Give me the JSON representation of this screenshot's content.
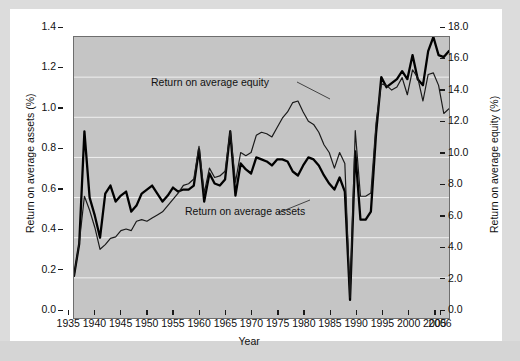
{
  "chart_data": {
    "type": "line",
    "title": "",
    "xlabel": "Year",
    "ylabel": "Return on average assets (%)",
    "y2label": "Return on average equity (%)",
    "xlim": [
      1934,
      2006
    ],
    "ylim": [
      0.0,
      1.4
    ],
    "y2lim": [
      0.0,
      18.0
    ],
    "grid": true,
    "legend_position": "inline-annotations",
    "x_tick_labels": [
      "1935",
      "1940",
      "1945",
      "1950",
      "1955",
      "1960",
      "1965",
      "1970",
      "1975",
      "1980",
      "1985",
      "1990",
      "1995",
      "2000",
      "2005",
      "2006"
    ],
    "x_tick_values": [
      1935,
      1940,
      1945,
      1950,
      1955,
      1960,
      1965,
      1970,
      1975,
      1980,
      1985,
      1990,
      1995,
      2000,
      2005,
      2006
    ],
    "y_tick_labels": [
      "0.0",
      "0.2",
      "0.4",
      "0.6",
      "0.8",
      "1.0",
      "1.2",
      "1.4"
    ],
    "y_tick_values": [
      0.0,
      0.2,
      0.4,
      0.6,
      0.8,
      1.0,
      1.2,
      1.4
    ],
    "y2_tick_labels": [
      "0.0",
      "2.0",
      "4.0",
      "6.0",
      "8.0",
      "10.0",
      "12.0",
      "14.0",
      "16.0",
      "18.0"
    ],
    "y2_tick_values": [
      0,
      2,
      4,
      6,
      8,
      10,
      12,
      14,
      16,
      18
    ],
    "annotations": [
      {
        "text": "Return on average equity",
        "x": 1958.5,
        "y_px": 76
      },
      {
        "text": "Return on average assets",
        "x": 1963.0,
        "y_px": 205
      }
    ],
    "series": [
      {
        "name": "Return on average assets",
        "axis": "left",
        "color": "#000000",
        "width": 2.3,
        "x": [
          1934,
          1935,
          1936,
          1937,
          1938,
          1939,
          1940,
          1941,
          1942,
          1943,
          1944,
          1945,
          1946,
          1947,
          1948,
          1949,
          1950,
          1951,
          1952,
          1953,
          1954,
          1955,
          1956,
          1957,
          1958,
          1959,
          1960,
          1961,
          1962,
          1963,
          1964,
          1965,
          1966,
          1967,
          1968,
          1969,
          1970,
          1971,
          1972,
          1973,
          1974,
          1975,
          1976,
          1977,
          1978,
          1979,
          1980,
          1981,
          1982,
          1983,
          1984,
          1985,
          1986,
          1987,
          1988,
          1989,
          1990,
          1991,
          1992,
          1993,
          1994,
          1995,
          1996,
          1997,
          1998,
          1999,
          2000,
          2001,
          2002,
          2003,
          2004,
          2005,
          2006
        ],
        "values": [
          0.21,
          0.37,
          0.93,
          0.6,
          0.51,
          0.4,
          0.62,
          0.66,
          0.58,
          0.61,
          0.63,
          0.53,
          0.56,
          0.62,
          0.64,
          0.66,
          0.62,
          0.58,
          0.61,
          0.65,
          0.63,
          0.64,
          0.64,
          0.66,
          0.84,
          0.58,
          0.72,
          0.67,
          0.66,
          0.69,
          0.93,
          0.61,
          0.77,
          0.74,
          0.72,
          0.8,
          0.79,
          0.78,
          0.76,
          0.79,
          0.79,
          0.78,
          0.73,
          0.71,
          0.76,
          0.8,
          0.79,
          0.76,
          0.71,
          0.67,
          0.64,
          0.7,
          0.63,
          0.09,
          0.83,
          0.49,
          0.49,
          0.53,
          0.92,
          1.2,
          1.15,
          1.17,
          1.19,
          1.23,
          1.19,
          1.31,
          1.19,
          1.16,
          1.33,
          1.4,
          1.31,
          1.3,
          1.33
        ]
      },
      {
        "name": "Return on average equity",
        "axis": "right",
        "color": "#1a1a1a",
        "width": 1.2,
        "x": [
          1934,
          1935,
          1936,
          1937,
          1938,
          1939,
          1940,
          1941,
          1942,
          1943,
          1944,
          1945,
          1946,
          1947,
          1948,
          1949,
          1950,
          1951,
          1952,
          1953,
          1954,
          1955,
          1956,
          1957,
          1958,
          1959,
          1960,
          1961,
          1962,
          1963,
          1964,
          1965,
          1966,
          1967,
          1968,
          1969,
          1970,
          1971,
          1972,
          1973,
          1974,
          1975,
          1976,
          1977,
          1978,
          1979,
          1980,
          1981,
          1982,
          1983,
          1984,
          1985,
          1986,
          1987,
          1988,
          1989,
          1990,
          1991,
          1992,
          1993,
          1994,
          1995,
          1996,
          1997,
          1998,
          1999,
          2000,
          2001,
          2002,
          2003,
          2004,
          2005,
          2006
        ],
        "values": [
          2.7,
          4.8,
          7.8,
          6.9,
          5.8,
          4.4,
          4.7,
          5.1,
          5.2,
          5.6,
          5.7,
          5.6,
          6.2,
          6.3,
          6.2,
          6.4,
          6.6,
          6.8,
          7.2,
          7.6,
          8.0,
          8.5,
          8.6,
          8.9,
          11.0,
          8.0,
          9.6,
          9.0,
          9.1,
          9.4,
          12.0,
          8.7,
          10.6,
          10.4,
          10.6,
          11.7,
          11.9,
          11.8,
          11.6,
          12.2,
          12.8,
          13.2,
          13.8,
          13.9,
          13.2,
          12.6,
          12.4,
          11.9,
          11.1,
          10.6,
          9.6,
          10.6,
          9.9,
          1.3,
          12.0,
          7.8,
          7.8,
          8.0,
          12.5,
          15.0,
          14.9,
          14.6,
          14.8,
          15.4,
          14.3,
          15.9,
          15.4,
          13.9,
          15.6,
          15.7,
          14.9,
          13.1,
          13.4
        ]
      }
    ]
  },
  "axes": {
    "x_title": "Year",
    "y_left_title": "Return on average assets (%)",
    "y_right_title": "Return on average equity (%)"
  },
  "colors": {
    "plot_background": "#c5c5c5",
    "page_background": "#d7d7d7",
    "card_background": "#ffffff",
    "gridline": "#f0f0f0",
    "axis": "#1a1a1a",
    "line": "#000000"
  }
}
